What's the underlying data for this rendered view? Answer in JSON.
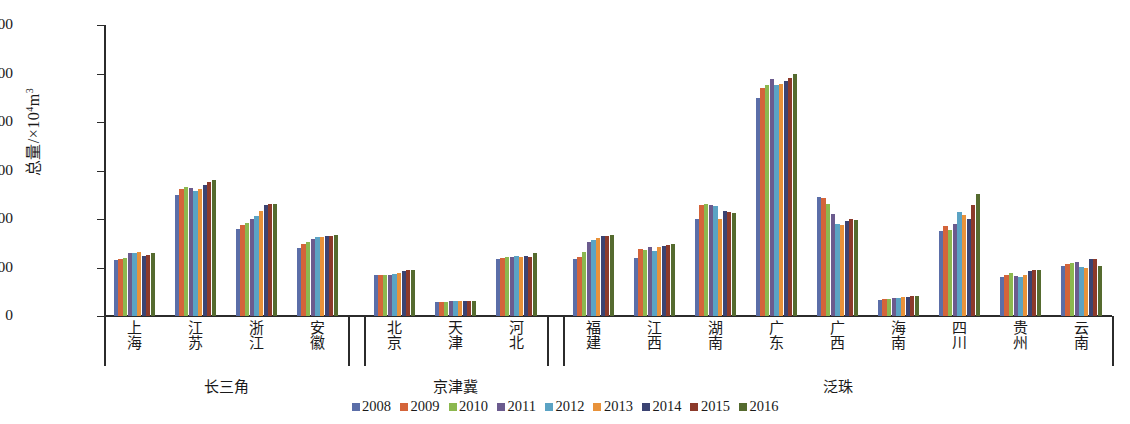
{
  "chart_data": {
    "type": "bar",
    "title": "",
    "xlabel": "",
    "ylabel_main": "总量/",
    "ylabel_unit_pre": "×10",
    "ylabel_unit_sup": "4",
    "ylabel_unit_post": "m",
    "ylabel_unit_post_sup": "3",
    "ylim": [
      0,
      12000
    ],
    "yticks": [
      0,
      2000,
      4000,
      6000,
      8000,
      10000,
      12000
    ],
    "ytick_labels": [
      "0",
      "2000",
      "4000",
      "6000",
      "8000",
      "10 000",
      "12 000"
    ],
    "grid": false,
    "legend_position": "bottom-center",
    "series_names": [
      "2008",
      "2009",
      "2010",
      "2011",
      "2012",
      "2013",
      "2014",
      "2015",
      "2016"
    ],
    "series_colors": [
      "#5b6ea8",
      "#d4643a",
      "#8cb84f",
      "#6b5b8e",
      "#5ba3c4",
      "#e8923a",
      "#3b4372",
      "#8c3a2b",
      "#556b2f"
    ],
    "categories": [
      "上海",
      "江苏",
      "浙江",
      "安徽",
      "北京",
      "天津",
      "河北",
      "福建",
      "江西",
      "湖南",
      "广东",
      "广西",
      "海南",
      "四川",
      "贵州",
      "云南"
    ],
    "groups": [
      {
        "name": "长三角",
        "categories": [
          "上海",
          "江苏",
          "浙江",
          "安徽"
        ]
      },
      {
        "name": "京津冀",
        "categories": [
          "北京",
          "天津",
          "河北"
        ]
      },
      {
        "name": "泛珠",
        "categories": [
          "福建",
          "江西",
          "湖南",
          "广东",
          "广西",
          "海南",
          "四川",
          "贵州",
          "云南"
        ]
      }
    ],
    "series": [
      {
        "name": "2008",
        "values": [
          2320,
          4980,
          3600,
          2820,
          1700,
          560,
          2340,
          2350,
          2380,
          4000,
          9000,
          4900,
          680,
          3500,
          1620,
          2080
        ]
      },
      {
        "name": "2009",
        "values": [
          2360,
          5250,
          3750,
          2960,
          1690,
          570,
          2400,
          2440,
          2760,
          4560,
          9400,
          4880,
          700,
          3700,
          1700,
          2160
        ]
      },
      {
        "name": "2010",
        "values": [
          2380,
          5340,
          3830,
          3040,
          1700,
          580,
          2440,
          2630,
          2740,
          4600,
          9520,
          4600,
          720,
          3560,
          1760,
          2200
        ]
      },
      {
        "name": "2011",
        "values": [
          2600,
          5280,
          4020,
          3160,
          1710,
          600,
          2440,
          3040,
          2860,
          4560,
          9760,
          4200,
          740,
          3780,
          1640,
          2240
        ]
      },
      {
        "name": "2012",
        "values": [
          2600,
          5160,
          4140,
          3240,
          1730,
          600,
          2490,
          3140,
          2680,
          4540,
          9520,
          3800,
          760,
          4280,
          1620,
          2040
        ]
      },
      {
        "name": "2013",
        "values": [
          2660,
          5240,
          4340,
          3260,
          1780,
          610,
          2420,
          3200,
          2860,
          4000,
          9560,
          3740,
          780,
          4180,
          1700,
          2000
        ]
      },
      {
        "name": "2014",
        "values": [
          2480,
          5420,
          4560,
          3280,
          1840,
          600,
          2460,
          3280,
          2900,
          4340,
          9680,
          3900,
          800,
          4020,
          1840,
          2360
        ]
      },
      {
        "name": "2015",
        "values": [
          2500,
          5540,
          4620,
          3320,
          1880,
          620,
          2440,
          3300,
          2920,
          4280,
          9800,
          4020,
          820,
          4560,
          1880,
          2360
        ]
      },
      {
        "name": "2016",
        "values": [
          2580,
          5620,
          4600,
          3360,
          1880,
          600,
          2580,
          3340,
          2960,
          4260,
          10000,
          3980,
          840,
          5020,
          1900,
          2080
        ]
      }
    ]
  }
}
